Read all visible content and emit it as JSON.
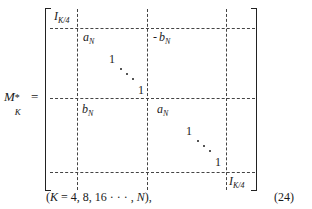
{
  "equation": {
    "lhs": {
      "symbol": "M",
      "subscript": "K",
      "superscript": "*",
      "equals": "="
    },
    "matrix": {
      "top_left_block": {
        "symbol": "I",
        "subscript": "K/4"
      },
      "bottom_right_block": {
        "symbol": "I",
        "subscript": "K/4"
      },
      "upper_center_left": {
        "symbol": "a",
        "subscript": "N"
      },
      "upper_center_right": {
        "symbol": "b",
        "subscript": "N"
      },
      "lower_center_left": {
        "symbol": "b",
        "subscript": "N"
      },
      "lower_center_right": {
        "symbol": "a",
        "subscript": "N"
      },
      "diagonal_upper": {
        "start": "1",
        "end": "1"
      },
      "diagonal_lower": {
        "start": "1",
        "end": "1"
      }
    },
    "condition": "(K = 4, 8, 16 · · · , N),",
    "condition_parts": {
      "open": "(",
      "var": "K",
      "values": " = 4, 8, 16 · · · , ",
      "last": "N",
      "close": "),"
    },
    "number": "(24)"
  }
}
